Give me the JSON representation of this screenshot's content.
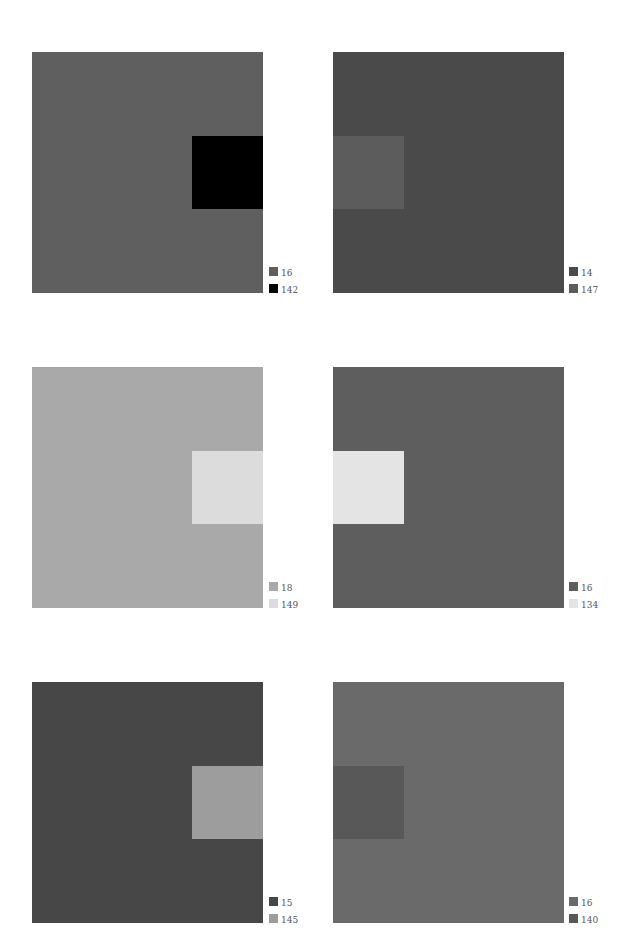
{
  "panels": [
    {
      "bg": "#5f5f5f",
      "inner": "#000000",
      "inner_pos": "right",
      "legend": [
        {
          "color": "#5f5f5f",
          "label": "16"
        },
        {
          "color": "#000000",
          "label": "142"
        }
      ]
    },
    {
      "bg": "#4a4a4a",
      "inner": "#5c5c5c",
      "inner_pos": "left",
      "legend": [
        {
          "color": "#4a4a4a",
          "label": "14"
        },
        {
          "color": "#5c5c5c",
          "label": "147"
        }
      ]
    },
    {
      "bg": "#a9a9a9",
      "inner": "#dcdcdc",
      "inner_pos": "right",
      "legend": [
        {
          "color": "#a9a9a9",
          "label": "18"
        },
        {
          "color": "#dcdcdc",
          "label": "149"
        }
      ]
    },
    {
      "bg": "#5e5e5e",
      "inner": "#e4e4e4",
      "inner_pos": "left",
      "legend": [
        {
          "color": "#5e5e5e",
          "label": "16"
        },
        {
          "color": "#e4e4e4",
          "label": "134"
        }
      ]
    },
    {
      "bg": "#474747",
      "inner": "#9d9d9d",
      "inner_pos": "right",
      "legend": [
        {
          "color": "#474747",
          "label": "15"
        },
        {
          "color": "#9d9d9d",
          "label": "145"
        }
      ]
    },
    {
      "bg": "#6a6a6a",
      "inner": "#585858",
      "inner_pos": "left",
      "legend": [
        {
          "color": "#6a6a6a",
          "label": "16"
        },
        {
          "color": "#585858",
          "label": "140"
        }
      ]
    }
  ]
}
